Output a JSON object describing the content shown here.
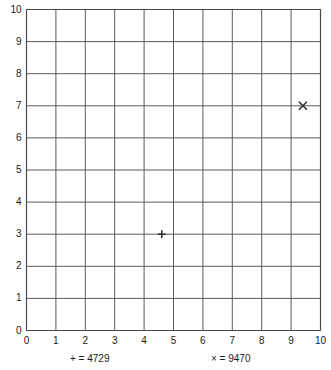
{
  "chart_data": {
    "type": "scatter",
    "title": "",
    "xlabel": "",
    "ylabel": "",
    "xlim": [
      0,
      10
    ],
    "ylim": [
      0,
      10
    ],
    "grid": true,
    "legend_position": "bottom",
    "x_ticks": [
      "0",
      "1",
      "2",
      "3",
      "4",
      "5",
      "6",
      "7",
      "8",
      "9",
      "10"
    ],
    "y_ticks": [
      "0",
      "1",
      "2",
      "3",
      "4",
      "5",
      "6",
      "7",
      "8",
      "9",
      "10"
    ],
    "series": [
      {
        "name": "4729",
        "marker": "plus",
        "legend_label": "+ = 4729",
        "legend_marker": "+",
        "points": [
          {
            "x": 4.6,
            "y": 3.0
          }
        ]
      },
      {
        "name": "9470",
        "marker": "cross",
        "legend_label": "× = 9470",
        "legend_marker": "×",
        "points": [
          {
            "x": 9.4,
            "y": 7.0
          }
        ]
      }
    ],
    "colors": {
      "grid": "#5a5a5a",
      "axis": "#4a4a4a",
      "marker": "#333333",
      "text": "#1a1a1a",
      "background": "#ffffff"
    }
  }
}
